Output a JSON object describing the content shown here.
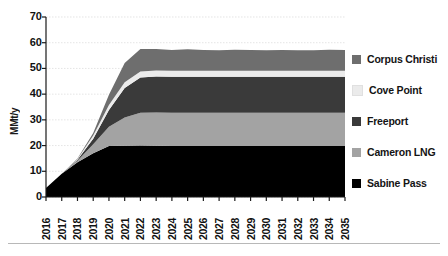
{
  "chart_data": {
    "type": "area",
    "stacked": true,
    "title": "",
    "subtitle": "",
    "xlabel": "",
    "ylabel": "MMt/y",
    "ylim": [
      0,
      70
    ],
    "yticks": [
      0,
      10,
      20,
      30,
      40,
      50,
      60,
      70
    ],
    "ytick_labels": [
      "0",
      "10",
      "20",
      "30",
      "40",
      "50",
      "60",
      "70"
    ],
    "grid": true,
    "grid_axis": "y",
    "legend_position": "right",
    "categories": [
      "2016",
      "2017",
      "2018",
      "2019",
      "2020",
      "2021",
      "2022",
      "2023",
      "2024",
      "2025",
      "2026",
      "2027",
      "2028",
      "2029",
      "2030",
      "2031",
      "2032",
      "2033",
      "2034",
      "2035"
    ],
    "x": [
      "2016",
      "2017",
      "2018",
      "2019",
      "2020",
      "2021",
      "2022",
      "2023",
      "2024",
      "2025",
      "2026",
      "2027",
      "2028",
      "2029",
      "2030",
      "2031",
      "2032",
      "2033",
      "2034",
      "2035"
    ],
    "series": [
      {
        "name": "Sabine Pass",
        "color": "#000000",
        "values": [
          3.5,
          9.0,
          13.5,
          17.0,
          19.8,
          19.9,
          20.0,
          19.9,
          19.8,
          19.8,
          19.8,
          19.8,
          19.8,
          19.8,
          19.8,
          19.8,
          19.8,
          19.8,
          19.8,
          19.8
        ]
      },
      {
        "name": "Cameron LNG",
        "color": "#a3a3a3",
        "values": [
          0.0,
          0.0,
          0.6,
          3.5,
          7.5,
          11.0,
          12.8,
          13.0,
          13.0,
          13.0,
          13.0,
          13.0,
          13.0,
          13.0,
          13.0,
          13.0,
          13.0,
          13.0,
          13.0,
          13.0
        ]
      },
      {
        "name": "Freeport",
        "color": "#3a3a3a",
        "values": [
          0.0,
          0.0,
          0.4,
          2.2,
          6.5,
          11.5,
          13.7,
          14.0,
          14.0,
          14.0,
          14.0,
          14.0,
          14.0,
          14.0,
          14.0,
          14.0,
          14.0,
          14.0,
          14.0,
          14.0
        ]
      },
      {
        "name": "Cove Point",
        "color": "#ebebeb",
        "values": [
          0.0,
          0.0,
          0.3,
          1.2,
          2.0,
          2.2,
          2.3,
          2.3,
          2.3,
          2.3,
          2.3,
          2.3,
          2.3,
          2.3,
          2.3,
          2.3,
          2.3,
          2.3,
          2.3,
          2.3
        ]
      },
      {
        "name": "Corpus Christi",
        "color": "#6e6e6e",
        "values": [
          0.0,
          0.0,
          0.2,
          1.0,
          4.0,
          7.5,
          8.8,
          8.4,
          8.1,
          8.4,
          8.1,
          8.0,
          8.2,
          8.1,
          8.0,
          8.1,
          8.0,
          8.0,
          8.2,
          8.1
        ]
      }
    ],
    "totals": [
      3.5,
      9.0,
      15.0,
      24.9,
      39.8,
      52.1,
      57.6,
      57.6,
      57.2,
      57.5,
      57.1,
      57.0,
      57.2,
      57.1,
      57.0,
      57.1,
      57.0,
      57.0,
      57.2,
      57.1
    ]
  },
  "legend": {
    "items": [
      {
        "label": "Corpus Christi",
        "color": "#6e6e6e"
      },
      {
        "label": "Cove Point",
        "color": "#ebebeb"
      },
      {
        "label": "Freeport",
        "color": "#3a3a3a"
      },
      {
        "label": "Cameron LNG",
        "color": "#a3a3a3"
      },
      {
        "label": "Sabine Pass",
        "color": "#000000"
      }
    ]
  },
  "axis": {
    "y_title": "MMt/y",
    "y_tick_labels": [
      "70",
      "60",
      "50",
      "40",
      "30",
      "20",
      "10",
      "0"
    ],
    "x_tick_labels": [
      "2016",
      "2017",
      "2018",
      "2019",
      "2020",
      "2021",
      "2022",
      "2023",
      "2024",
      "2025",
      "2026",
      "2027",
      "2028",
      "2029",
      "2030",
      "2031",
      "2032",
      "2033",
      "2034",
      "2035"
    ]
  },
  "colors": {
    "axis_line": "#1a1a1a",
    "grid_line": "#d8d8d8",
    "background": "#ffffff",
    "text": "#111111",
    "bottom_rule": "#b8b8b8"
  }
}
